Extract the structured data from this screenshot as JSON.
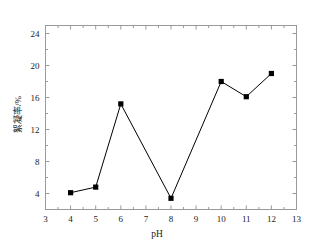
{
  "chart_data": {
    "type": "line",
    "title": "",
    "subtitle": "",
    "xlabel": "pH",
    "ylabel": "絮凝率/%",
    "x": [
      4,
      5,
      6,
      8,
      10,
      11,
      12
    ],
    "values": [
      4.1,
      4.8,
      15.2,
      3.4,
      18.0,
      16.1,
      19.0
    ],
    "series": [
      {
        "name": "絮凝率",
        "x": [
          4,
          5,
          6,
          8,
          10,
          11,
          12
        ],
        "values": [
          4.1,
          4.8,
          15.2,
          3.4,
          18.0,
          16.1,
          19.0
        ]
      }
    ],
    "xlim": [
      3,
      13
    ],
    "ylim": [
      2.0,
      25.0
    ],
    "xticks": [
      3,
      4,
      5,
      6,
      7,
      8,
      9,
      10,
      11,
      12,
      13
    ],
    "xtick_labels": [
      "3",
      "4",
      "5",
      "6",
      "7",
      "8",
      "9",
      "10",
      "11",
      "12",
      "13"
    ],
    "yticks": [
      4,
      8,
      12,
      16,
      20,
      24
    ],
    "ytick_labels": [
      "4",
      "8",
      "12",
      "16",
      "20",
      "24"
    ],
    "x_minor_ticks": [
      3.5,
      4.5,
      5.5,
      6.5,
      7.5,
      8.5,
      9.5,
      10.5,
      11.5,
      12.5
    ],
    "y_minor_ticks": [
      6,
      10,
      14,
      18,
      22
    ],
    "grid": false,
    "legend": null,
    "legend_position": "none",
    "marker": "square",
    "marker_color": "#000000",
    "line_color": "#000000",
    "frame_color": "#9a9a9a",
    "background": "#ffffff",
    "annotations": []
  },
  "axes": {
    "x_axis_name": "pH",
    "y_axis_name": "絮凝率/%"
  }
}
